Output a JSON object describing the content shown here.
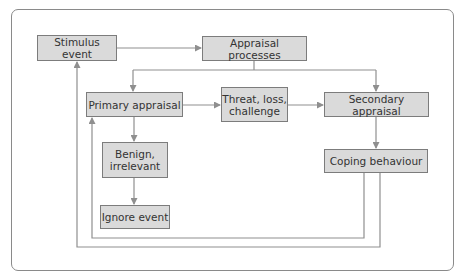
{
  "diagram": {
    "nodes": {
      "stimulus_event": "Stimulus event",
      "appraisal_processes": "Appraisal processes",
      "primary_appraisal": "Primary appraisal",
      "threat_loss_challenge": "Threat, loss,\nchallenge",
      "secondary_appraisal": "Secondary appraisal",
      "benign_irrelevant": "Benign,\nirrelevant",
      "ignore_event": "Ignore event",
      "coping_behaviour": "Coping behaviour"
    },
    "edges": [
      [
        "Stimulus event",
        "Appraisal processes"
      ],
      [
        "Appraisal processes",
        "Primary appraisal"
      ],
      [
        "Appraisal processes",
        "Secondary appraisal"
      ],
      [
        "Primary appraisal",
        "Threat, loss, challenge"
      ],
      [
        "Threat, loss, challenge",
        "Secondary appraisal"
      ],
      [
        "Primary appraisal",
        "Benign, irrelevant"
      ],
      [
        "Benign, irrelevant",
        "Ignore event"
      ],
      [
        "Secondary appraisal",
        "Coping behaviour"
      ],
      [
        "Coping behaviour",
        "Primary appraisal"
      ],
      [
        "Coping behaviour",
        "Stimulus event"
      ]
    ],
    "colors": {
      "box_fill": "#dadada",
      "box_border": "#7c7c7c",
      "line": "#8f8f8f",
      "text": "#333333"
    }
  }
}
